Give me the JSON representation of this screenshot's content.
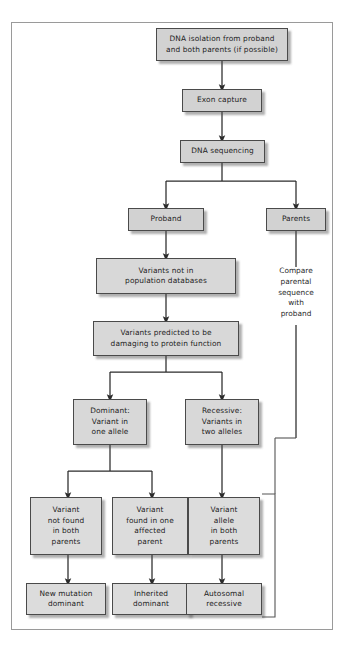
{
  "figure": {
    "frame_color": "#9a9a9a",
    "box_fill": "#d2d2d2",
    "box_border": "#4a4a4a",
    "connector_color": "#2b2b2b",
    "background": "#ffffff",
    "caption": ""
  },
  "nodes": {
    "dna_isolation": "DNA isolation from proband\nand both parents (if possible)",
    "exon_capture": "Exon capture",
    "dna_sequencing": "DNA sequencing",
    "proband": "Proband",
    "parents": "Parents",
    "variants_not_in_db": "Variants not in\npopulation databases",
    "variants_damaging": "Variants predicted to be\ndamaging to protein function",
    "dominant": "Dominant:\nVariant in\none allele",
    "recessive": "Recessive:\nVariants in\ntwo alleles",
    "variant_not_found": "Variant\nnot found\nin both\nparents",
    "variant_found_one": "Variant\nfound in one\naffected\nparent",
    "variant_allele_both": "Variant\nallele\nin both\nparents",
    "new_mutation_dominant": "New mutation\ndominant",
    "inherited_dominant": "Inherited\ndominant",
    "autosomal_recessive": "Autosomal\nrecessive"
  },
  "annotations": {
    "compare_parental": "Compare\nparental\nsequence\nwith\nproband"
  }
}
